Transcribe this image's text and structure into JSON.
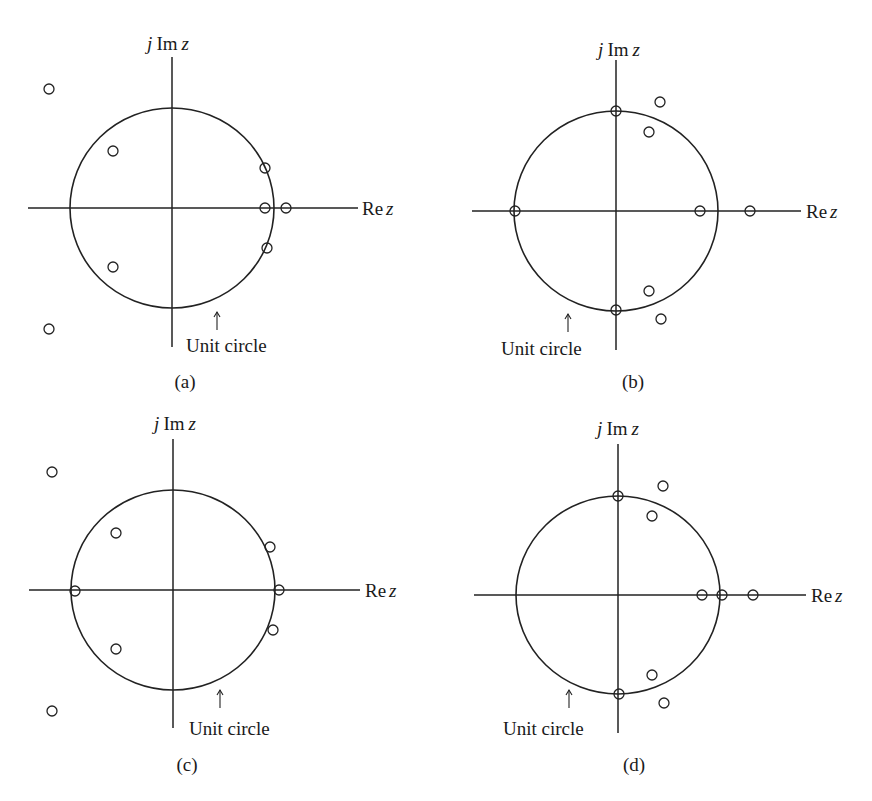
{
  "figure": {
    "panels": [
      {
        "id": "a",
        "caption": "(a)",
        "im_label_j": "j",
        "im_label_im": "Im",
        "im_label_z": "z",
        "re_label_re": "Re",
        "re_label_z": "z",
        "unit_circle_label": "Unit circle",
        "center": [
          172,
          208
        ],
        "radius": [
          102,
          100
        ],
        "v_axis": [
          57,
          347
        ],
        "h_axis": [
          28,
          358
        ],
        "im_label_pos": [
          168,
          50
        ],
        "re_label_pos": [
          362,
          215
        ],
        "arrow": [
          217,
          312,
          330
        ],
        "unit_label_pos": [
          186,
          352
        ],
        "caption_pos": [
          185,
          388
        ],
        "zeros": [
          [
            49,
            89
          ],
          [
            113,
            151
          ],
          [
            265,
            168
          ],
          [
            265,
            208
          ],
          [
            286,
            208
          ],
          [
            267,
            248
          ],
          [
            113,
            267
          ],
          [
            49,
            329
          ]
        ]
      },
      {
        "id": "b",
        "caption": "(b)",
        "im_label_j": "j",
        "im_label_im": "Im",
        "im_label_z": "z",
        "re_label_re": "Re",
        "re_label_z": "z",
        "unit_circle_label": "Unit circle",
        "center": [
          616,
          211
        ],
        "radius": [
          102,
          100
        ],
        "v_axis": [
          60,
          350
        ],
        "h_axis": [
          472,
          801
        ],
        "im_label_pos": [
          619,
          56
        ],
        "re_label_pos": [
          806,
          218
        ],
        "arrow": [
          568,
          314,
          332
        ],
        "unit_label_pos": [
          501,
          355
        ],
        "caption_pos": [
          633,
          388
        ],
        "zeros": [
          [
            616,
            111
          ],
          [
            660,
            102
          ],
          [
            649,
            132
          ],
          [
            515,
            211
          ],
          [
            700,
            211
          ],
          [
            750,
            211
          ],
          [
            649,
            291
          ],
          [
            661,
            319
          ],
          [
            616,
            310
          ]
        ]
      },
      {
        "id": "c",
        "caption": "(c)",
        "im_label_j": "j",
        "im_label_im": "Im",
        "im_label_z": "z",
        "re_label_re": "Re",
        "re_label_z": "z",
        "unit_circle_label": "Unit circle",
        "center": [
          173,
          590
        ],
        "radius": [
          102,
          100
        ],
        "v_axis": [
          439,
          728
        ],
        "h_axis": [
          29,
          360
        ],
        "im_label_pos": [
          175,
          430
        ],
        "re_label_pos": [
          365,
          597
        ],
        "arrow": [
          220,
          690,
          708
        ],
        "unit_label_pos": [
          189,
          735
        ],
        "caption_pos": [
          187,
          771
        ],
        "zeros": [
          [
            52,
            472
          ],
          [
            116,
            533
          ],
          [
            270,
            547
          ],
          [
            75,
            591
          ],
          [
            279,
            590
          ],
          [
            273,
            630
          ],
          [
            116,
            649
          ],
          [
            52,
            711
          ]
        ]
      },
      {
        "id": "d",
        "caption": "(d)",
        "im_label_j": "j",
        "im_label_im": "Im",
        "im_label_z": "z",
        "re_label_re": "Re",
        "re_label_z": "z",
        "unit_circle_label": "Unit circle",
        "center": [
          618,
          595
        ],
        "radius": [
          102,
          99
        ],
        "v_axis": [
          444,
          733
        ],
        "h_axis": [
          474,
          806
        ],
        "im_label_pos": [
          618,
          435
        ],
        "re_label_pos": [
          811,
          602
        ],
        "arrow": [
          569,
          690,
          708
        ],
        "unit_label_pos": [
          503,
          735
        ],
        "caption_pos": [
          634,
          771
        ],
        "zeros": [
          [
            618,
            496
          ],
          [
            663,
            486
          ],
          [
            652,
            516
          ],
          [
            702,
            595
          ],
          [
            722,
            595
          ],
          [
            753,
            595
          ],
          [
            652,
            675
          ],
          [
            664,
            703
          ],
          [
            619,
            694
          ]
        ]
      }
    ],
    "colors": {
      "ink": "#222222",
      "background": "#ffffff"
    },
    "marker_radius": 5
  }
}
